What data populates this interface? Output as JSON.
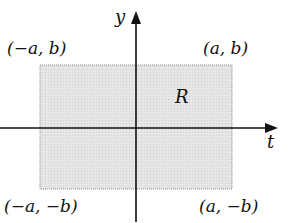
{
  "diagram": {
    "axes": {
      "vertical_label": "y",
      "horizontal_label": "t"
    },
    "region_label": "R",
    "corners": {
      "top_left": "(−a, b)",
      "top_right": "(a, b)",
      "bottom_left": "(−a, −b)",
      "bottom_right": "(a, −b)"
    },
    "colors": {
      "region_fill": "#e3e3e3",
      "region_border": "#8a8a8a",
      "axis": "#111111"
    }
  }
}
